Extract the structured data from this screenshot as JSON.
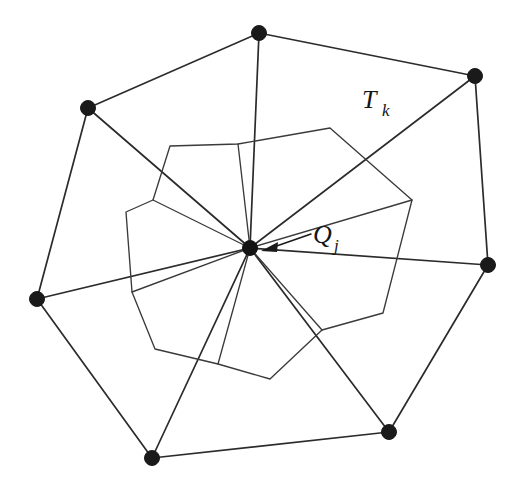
{
  "figure": {
    "type": "mesh-diagram",
    "caption_labels": {
      "triangle_label": "T",
      "triangle_subscript": "k",
      "vertex_label": "Q",
      "vertex_subscript": "j"
    },
    "colors": {
      "background": "#ffffff",
      "edge": "#2b2b2b",
      "inner_edge": "#3a3a3a",
      "vertex": "#1a1a1a"
    }
  },
  "chart_data": {
    "type": "diagram",
    "title": "",
    "center_vertex": {
      "name": "Q_j",
      "x": 250,
      "y": 248,
      "radius": 7.5
    },
    "outer_vertices": [
      {
        "id": "v0",
        "x": 259,
        "y": 33,
        "radius": 7.5
      },
      {
        "id": "v1",
        "x": 475,
        "y": 76,
        "radius": 7.5
      },
      {
        "id": "v2",
        "x": 488,
        "y": 265,
        "radius": 7.5
      },
      {
        "id": "v3",
        "x": 389,
        "y": 432,
        "radius": 7.5
      },
      {
        "id": "v4",
        "x": 152,
        "y": 458,
        "radius": 7.5
      },
      {
        "id": "v5",
        "x": 37,
        "y": 299,
        "radius": 7.5
      },
      {
        "id": "v6",
        "x": 88,
        "y": 108,
        "radius": 7.5
      }
    ],
    "outer_boundary_path": "M 259 33 L 475 76 L 488 265 L 389 432 L 152 458 L 37 299 L 88 108 Z",
    "spokes": [
      "M 250 248 L 259 33",
      "M 250 248 L 475 76",
      "M 250 248 L 488 265",
      "M 250 248 L 389 432",
      "M 250 248 L 152 458",
      "M 250 248 L 37 299",
      "M 250 248 L 88 108"
    ],
    "inner_pinwheel_paths": [
      "M 250 248 L 238 144 L 170 146 L 153 200 L 250 248",
      "M 250 248 L 170 146 L 153 200 L 126 212 L 132 292 L 250 248",
      "M 250 248 L 126 212 L 132 292 L 155 349 L 250 248",
      "M 250 248 L 132 292 L 155 349 L 218 364 L 250 248",
      "M 250 248 L 155 349 L 218 364 L 270 379 L 250 248",
      "M 250 248 L 218 364 L 270 379 L 322 330 L 250 248",
      "M 250 248 L 270 379 L 322 330 L 383 313 L 250 248",
      "M 250 248 L 322 330 L 383 313 L 412 200 L 250 248",
      "M 250 248 L 383 313 L 412 200 L 330 128 L 250 248",
      "M 250 248 L 412 200 L 330 128 L 238 144 L 250 248"
    ],
    "inner_polyline_segments": [
      "M 153 200 L 170 146 L 238 144 L 330 128 L 412 200 L 383 313 L 322 330 L 270 379 L 218 364 L 155 349 L 132 292 L 126 212 L 153 200",
      "M 250 248 L 153 200",
      "M 250 248 L 132 292",
      "M 250 248 L 218 364",
      "M 250 248 L 322 330",
      "M 250 248 L 412 200",
      "M 250 248 L 238 144"
    ],
    "annotations": [
      {
        "text": "T_k",
        "x": 375,
        "y": 105,
        "anchor_point": null,
        "has_arrow": false
      },
      {
        "text": "Q_j",
        "x": 318,
        "y": 240,
        "anchor_point": {
          "x": 258,
          "y": 250
        },
        "has_arrow": true,
        "leader_from": {
          "x": 311,
          "y": 234
        },
        "leader_to": {
          "x": 262,
          "y": 250
        }
      }
    ],
    "axis": {
      "visible": false
    },
    "grid": false,
    "legend": null
  }
}
